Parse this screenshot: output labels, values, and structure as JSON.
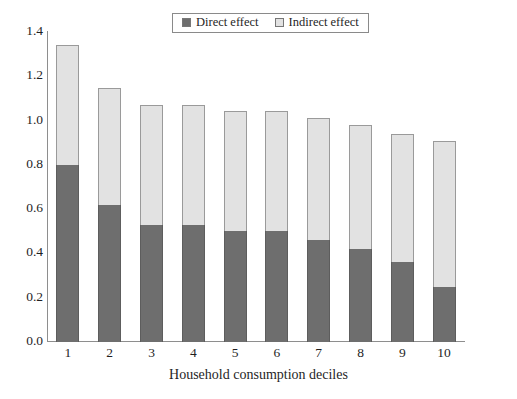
{
  "chart_data": {
    "type": "bar",
    "stacked": true,
    "title": "",
    "xlabel": "Household consumption deciles",
    "ylabel": "",
    "categories": [
      "1",
      "2",
      "3",
      "4",
      "5",
      "6",
      "7",
      "8",
      "9",
      "10"
    ],
    "series": [
      {
        "name": "Direct effect",
        "color": "#6e6e6e",
        "values": [
          0.8,
          0.62,
          0.53,
          0.53,
          0.5,
          0.5,
          0.46,
          0.42,
          0.36,
          0.25
        ]
      },
      {
        "name": "Indirect effect",
        "color": "#e2e2e2",
        "values": [
          0.54,
          0.53,
          0.54,
          0.54,
          0.54,
          0.54,
          0.55,
          0.56,
          0.58,
          0.66
        ]
      }
    ],
    "totals": [
      1.34,
      1.15,
      1.07,
      1.07,
      1.04,
      1.04,
      1.01,
      0.98,
      0.94,
      0.91
    ],
    "ylim": [
      0.0,
      1.4
    ],
    "ytick_labels": [
      "0.0",
      "0.2",
      "0.4",
      "0.6",
      "0.8",
      "1.0",
      "1.2",
      "1.4"
    ],
    "ytick_values": [
      0.0,
      0.2,
      0.4,
      0.6,
      0.8,
      1.0,
      1.2,
      1.4
    ],
    "grid": false,
    "legend_position": "top-center"
  },
  "legend": {
    "entries": [
      {
        "label": "Direct effect",
        "color": "#6e6e6e"
      },
      {
        "label": "Indirect effect",
        "color": "#e2e2e2"
      }
    ]
  },
  "axis": {
    "x_title": "Household consumption deciles"
  },
  "colors": {
    "direct": "#6e6e6e",
    "indirect": "#e2e2e2",
    "axis": "#8e8e8e",
    "text": "#1f1f1f",
    "background": "#ffffff"
  }
}
